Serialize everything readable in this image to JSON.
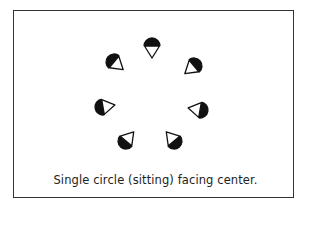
{
  "diagram": {
    "caption": "Single circle (sitting) facing center.",
    "center": [
      152,
      98
    ],
    "legend_note": "Each figure: half-filled circle (person) with white triangle pointing toward the center",
    "figures": [
      {
        "id": 1,
        "x": 152,
        "y": 46,
        "angle": 90
      },
      {
        "id": 2,
        "x": 114,
        "y": 62,
        "angle": 40
      },
      {
        "id": 3,
        "x": 194,
        "y": 66,
        "angle": 140
      },
      {
        "id": 4,
        "x": 103,
        "y": 107,
        "angle": -10
      },
      {
        "id": 5,
        "x": 200,
        "y": 110,
        "angle": 190
      },
      {
        "id": 6,
        "x": 126,
        "y": 141,
        "angle": -50
      },
      {
        "id": 7,
        "x": 174,
        "y": 141,
        "angle": 230
      }
    ],
    "colors": {
      "fill": "#111111",
      "stroke": "#111111",
      "frame": "#333333",
      "background": "#ffffff"
    }
  }
}
